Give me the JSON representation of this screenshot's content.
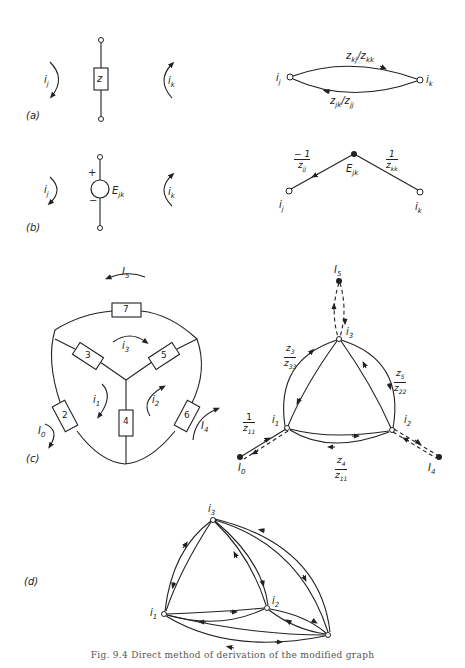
{
  "figure": {
    "caption": "Fig. 9.4  Direct method of derivation of the modified graph",
    "panels": {
      "a": {
        "tag": "(a)",
        "element_label": "z",
        "left_current": "i_j",
        "right_current": "i_k",
        "graph": {
          "nodes": [
            "i_j",
            "i_k"
          ],
          "upper_edge_label": "z_kj / z_kk",
          "lower_edge_label": "z_jk / z_jj"
        }
      },
      "b": {
        "tag": "(b)",
        "source_label": "E_jk",
        "plus": "+",
        "minus": "−",
        "left_current": "i_j",
        "right_current": "i_k",
        "graph": {
          "source_node": "E_jk",
          "left_edge_label_num": "− 1",
          "left_edge_label_den": "z_jj",
          "right_edge_label_num": "1",
          "right_edge_label_den": "z_kk",
          "nodes": [
            "i_j",
            "i_k"
          ]
        }
      },
      "c": {
        "tag": "(c)",
        "impedances": [
          "2",
          "3",
          "4",
          "5",
          "6",
          "7"
        ],
        "loop_currents": [
          "i_1",
          "i_2",
          "i_3"
        ],
        "external_currents": [
          "I_0",
          "I_4",
          "I_5"
        ],
        "graph": {
          "nodes": [
            "i_1",
            "i_2",
            "i_3",
            "I_0",
            "I_4",
            "I_5"
          ],
          "labels": {
            "z3_z33": [
              "z_3",
              "z_33"
            ],
            "z5_z22": [
              "z_5",
              "z_22"
            ],
            "one_z11": [
              "1",
              "z_11"
            ],
            "z4_z11": [
              "z_4",
              "z_11"
            ]
          }
        }
      },
      "d": {
        "tag": "(d)",
        "nodes": [
          "i_1",
          "i_2",
          "i_3"
        ]
      }
    }
  }
}
